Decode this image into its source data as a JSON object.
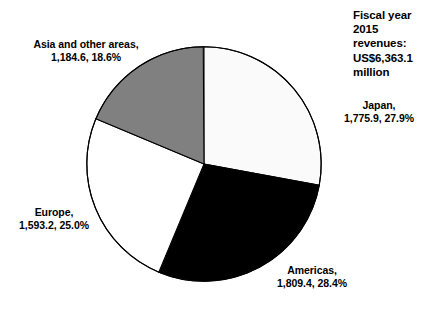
{
  "chart_data": {
    "type": "pie",
    "title": "Fiscal year 2015 revenues: US$6,363.1 million",
    "title_lines": "Fiscal year\n2015\nrevenues:\nUS$6,363.1\nmillion",
    "units": "US$ million",
    "total": 6363.1,
    "categories": [
      "Japan",
      "Americas",
      "Europe",
      "Asia and other areas"
    ],
    "values": [
      1775.9,
      1809.4,
      1593.2,
      1184.6
    ],
    "percents": [
      27.9,
      28.4,
      25.0,
      18.6
    ],
    "start_angle_deg": 0,
    "direction": "clockwise",
    "legend": "none",
    "grid": false,
    "xlabel": "",
    "ylabel": "",
    "slices": [
      {
        "name": "Japan",
        "value": "1,775.9",
        "percent": "27.9%",
        "value_number": 1775.9,
        "percent_number": 27.9,
        "color": "#fafafa",
        "stroke": "#000000",
        "label_text": "Japan,\n1,775.9, 27.9%"
      },
      {
        "name": "Americas",
        "value": "1,809.4",
        "percent": "28.4%",
        "value_number": 1809.4,
        "percent_number": 28.4,
        "color": "#000000",
        "stroke": "#000000",
        "label_text": "Americas,\n1,809.4, 28.4%"
      },
      {
        "name": "Europe",
        "value": "1,593.2",
        "percent": "25.0%",
        "value_number": 1593.2,
        "percent_number": 25.0,
        "color": "#ffffff",
        "stroke": "#000000",
        "label_text": "Europe,\n1,593.2, 25.0%"
      },
      {
        "name": "Asia and other areas",
        "value": "1,184.6",
        "percent": "18.6%",
        "value_number": 1184.6,
        "percent_number": 18.6,
        "color": "#808080",
        "stroke": "#000000",
        "label_text": "Asia and other areas,\n1,184.6, 18.6%"
      }
    ]
  },
  "colors": {
    "background": "#ffffff",
    "text": "#000000",
    "outline": "#000000",
    "japan": "#fafafa",
    "americas": "#000000",
    "europe": "#ffffff",
    "asia": "#808080"
  }
}
